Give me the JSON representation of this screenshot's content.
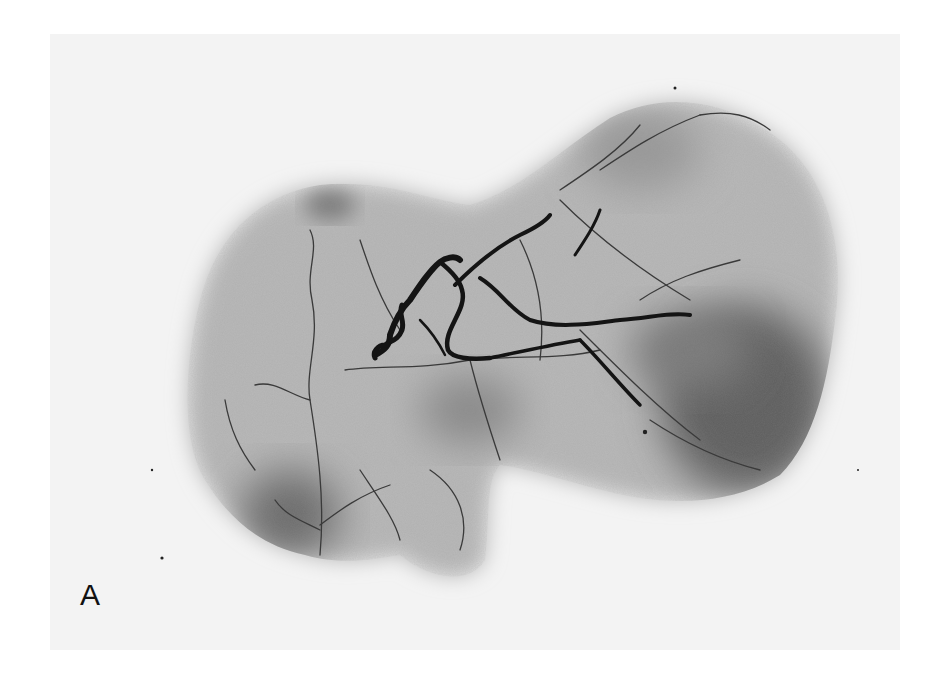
{
  "figure": {
    "panel_label": "A",
    "colors": {
      "page_background": "#ffffff",
      "film_background": "#f3f3f3",
      "tissue_light": "#b8b8b8",
      "tissue_dark": "#5a5a5a",
      "vessel": "#141414"
    }
  }
}
